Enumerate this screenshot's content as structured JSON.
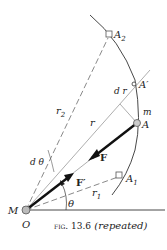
{
  "figure": {
    "caption_prefix": "fig. 13.6",
    "caption_suffix": "(repeated)",
    "labels": {
      "A2": "A",
      "A2_sub": "2",
      "A_prime": "A′",
      "dr": "d r",
      "m": "m",
      "A": "A",
      "r2": "r",
      "r2_sub": "2",
      "r": "r",
      "F": "F",
      "d_theta": "d θ",
      "F_prime": "F′",
      "A1": "A",
      "A1_sub": "1",
      "r1": "r",
      "r1_sub": "1",
      "theta": "θ",
      "M": "M",
      "O": "O"
    },
    "colors": {
      "ink": "#222222",
      "light": "#888888",
      "point_fill": "#bbbbbb"
    }
  }
}
